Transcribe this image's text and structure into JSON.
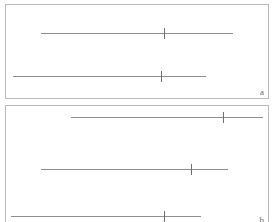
{
  "figure": {
    "type": "interval-plot",
    "background_color": "#ffffff",
    "line_color": "#8e8e8e",
    "tick_color": "#6f6f6f",
    "border_color": "#b9b9b9",
    "label_color": "#6a6a6a"
  },
  "panels": [
    {
      "id": "a",
      "label": "a",
      "x": 5,
      "y": 4,
      "width": 264,
      "height": 95,
      "intervals": [
        {
          "name": "interval-a1",
          "y": 28,
          "x_start": 35,
          "x_end": 227,
          "tick_x": 158
        },
        {
          "name": "interval-a2",
          "y": 71,
          "x_start": 7,
          "x_end": 200,
          "tick_x": 155
        }
      ]
    },
    {
      "id": "b",
      "label": "b",
      "x": 5,
      "y": 105,
      "width": 264,
      "height": 122,
      "intervals": [
        {
          "name": "interval-b1",
          "y": 11,
          "x_start": 65,
          "x_end": 257,
          "tick_x": 217
        },
        {
          "name": "interval-b2",
          "y": 63,
          "x_start": 35,
          "x_end": 222,
          "tick_x": 185
        },
        {
          "name": "interval-b3",
          "y": 110,
          "x_start": 5,
          "x_end": 195,
          "tick_x": 158
        }
      ]
    }
  ],
  "chart_data": {
    "type": "line",
    "title": "",
    "subtitle": "",
    "xlabel": "",
    "ylabel": "",
    "grid": false,
    "legend": "none",
    "series": [
      {
        "name": "panel a",
        "panel": "a",
        "points": [
          {
            "row": 1,
            "low": 35,
            "high": 227,
            "estimate": 158
          },
          {
            "row": 2,
            "low": 7,
            "high": 200,
            "estimate": 155
          }
        ]
      },
      {
        "name": "panel b",
        "panel": "b",
        "points": [
          {
            "row": 1,
            "low": 65,
            "high": 257,
            "estimate": 217
          },
          {
            "row": 2,
            "low": 35,
            "high": 222,
            "estimate": 185
          },
          {
            "row": 3,
            "low": 5,
            "high": 195,
            "estimate": 158
          }
        ]
      }
    ],
    "categories": [
      "a1",
      "a2",
      "b1",
      "b2",
      "b3"
    ],
    "values": [
      158,
      155,
      217,
      185,
      158
    ]
  }
}
